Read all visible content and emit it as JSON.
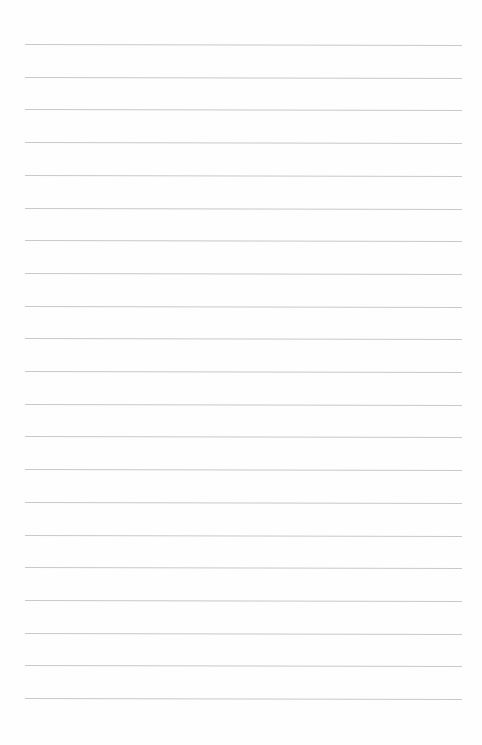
{
  "page": {
    "type": "lined-paper",
    "background": "#fefefe",
    "rule_color": "#c9c9c9",
    "rule_count": 21,
    "first_rule_y": 44,
    "rule_spacing": 32.7,
    "rule_left": 25,
    "rule_right": 462
  }
}
